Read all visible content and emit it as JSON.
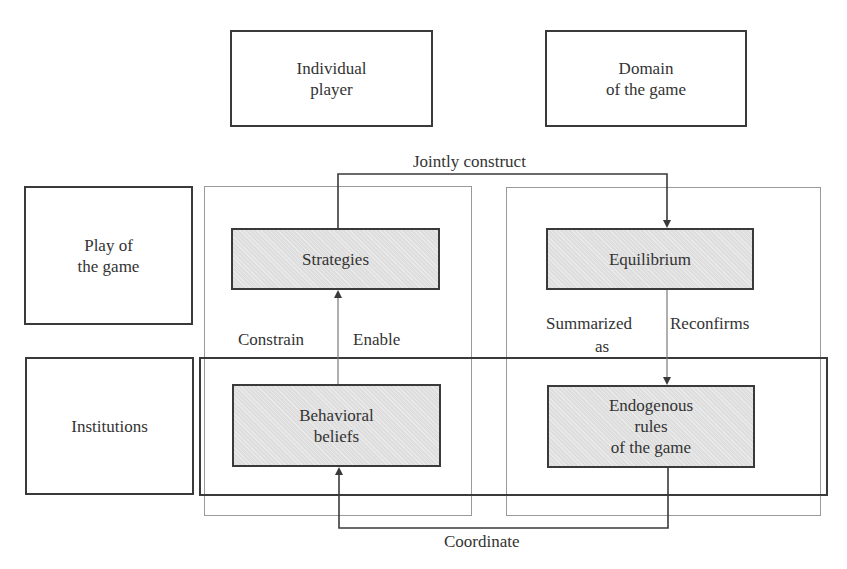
{
  "diagram": {
    "column_headers": [
      {
        "id": "individual-player",
        "text": "Individual\nplayer"
      },
      {
        "id": "domain-of-game",
        "text": "Domain\nof the game"
      }
    ],
    "row_headers": [
      {
        "id": "play-of-game",
        "text": "Play of\nthe game"
      },
      {
        "id": "institutions",
        "text": "Institutions"
      }
    ],
    "nodes": {
      "strategies": "Strategies",
      "equilibrium": "Equilibrium",
      "behavioral_beliefs": "Behavioral\nbeliefs",
      "endogenous_rules": "Endogenous\nrules\nof the game"
    },
    "edges": [
      {
        "from": "strategies",
        "to": "equilibrium",
        "label": "Jointly construct"
      },
      {
        "from": "behavioral_beliefs",
        "to": "strategies",
        "label_left": "Constrain",
        "label_right": "Enable"
      },
      {
        "from": "equilibrium",
        "to": "endogenous_rules",
        "label_left": "Summarized\nas",
        "label_right": "Reconfirms"
      },
      {
        "from": "endogenous_rules",
        "to": "behavioral_beliefs",
        "label": "Coordinate"
      }
    ],
    "labels": {
      "jointly_construct": "Jointly construct",
      "constrain": "Constrain",
      "enable": "Enable",
      "summarized": "Summarized",
      "as": "as",
      "reconfirms": "Reconfirms",
      "coordinate": "Coordinate"
    },
    "colors": {
      "box_border": "#3a3a3a",
      "shaded_fill": "#dedede",
      "group_frame": "#9a9a9a",
      "text": "#333333"
    }
  }
}
